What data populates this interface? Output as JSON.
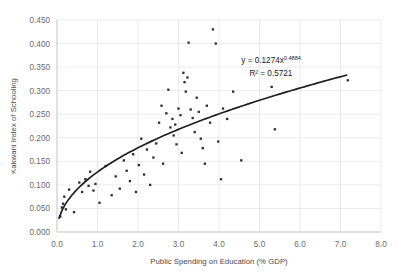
{
  "chart_data": {
    "type": "scatter",
    "title": "",
    "xlabel": "Public Spending on Education (% GDP)",
    "ylabel": "Kakwani Index of Schooling",
    "xlim": [
      0.0,
      8.0
    ],
    "ylim": [
      0.0,
      0.45
    ],
    "grid": true,
    "legend": "none",
    "xticks": [
      "0.0",
      "1.0",
      "2.0",
      "3.0",
      "4.0",
      "5.0",
      "6.0",
      "7.0",
      "8.0"
    ],
    "xtick_values": [
      0.0,
      1.0,
      2.0,
      3.0,
      4.0,
      5.0,
      6.0,
      7.0,
      8.0
    ],
    "yticks": [
      "0.000",
      "0.050",
      "0.100",
      "0.150",
      "0.200",
      "0.250",
      "0.300",
      "0.350",
      "0.400",
      "0.450"
    ],
    "ytick_values": [
      0.0,
      0.05,
      0.1,
      0.15,
      0.2,
      0.25,
      0.3,
      0.35,
      0.4,
      0.45
    ],
    "annotations": [
      {
        "name": "regression-equation",
        "text_prefix": "y = 0.1274x",
        "exponent": "0.4884",
        "x": 4.55,
        "y": 0.358
      },
      {
        "name": "r-squared",
        "text": "R² = 0.5721",
        "x": 4.75,
        "y": 0.332
      }
    ],
    "trendline": {
      "type": "power",
      "coefficient": 0.1274,
      "exponent": 0.4884,
      "label": "y = 0.1274x^0.4884",
      "r_squared": 0.5721,
      "x_start": 0.05,
      "x_end": 7.15,
      "color": "#1f1f1f"
    },
    "marker_color": "#2b2b2b",
    "points": [
      [
        0.08,
        0.033
      ],
      [
        0.12,
        0.052
      ],
      [
        0.15,
        0.06
      ],
      [
        0.18,
        0.075
      ],
      [
        0.22,
        0.048
      ],
      [
        0.3,
        0.09
      ],
      [
        0.42,
        0.042
      ],
      [
        0.55,
        0.105
      ],
      [
        0.62,
        0.085
      ],
      [
        0.7,
        0.112
      ],
      [
        0.78,
        0.098
      ],
      [
        0.82,
        0.128
      ],
      [
        0.9,
        0.088
      ],
      [
        0.95,
        0.102
      ],
      [
        1.05,
        0.062
      ],
      [
        1.2,
        0.14
      ],
      [
        1.35,
        0.078
      ],
      [
        1.45,
        0.118
      ],
      [
        1.55,
        0.092
      ],
      [
        1.65,
        0.152
      ],
      [
        1.72,
        0.13
      ],
      [
        1.8,
        0.108
      ],
      [
        1.88,
        0.165
      ],
      [
        1.95,
        0.085
      ],
      [
        2.02,
        0.142
      ],
      [
        2.08,
        0.198
      ],
      [
        2.15,
        0.122
      ],
      [
        2.22,
        0.175
      ],
      [
        2.3,
        0.1
      ],
      [
        2.38,
        0.158
      ],
      [
        2.45,
        0.188
      ],
      [
        2.52,
        0.232
      ],
      [
        2.58,
        0.268
      ],
      [
        2.62,
        0.145
      ],
      [
        2.7,
        0.252
      ],
      [
        2.75,
        0.302
      ],
      [
        2.8,
        0.222
      ],
      [
        2.85,
        0.24
      ],
      [
        2.88,
        0.205
      ],
      [
        2.92,
        0.228
      ],
      [
        2.95,
        0.186
      ],
      [
        3.0,
        0.262
      ],
      [
        3.05,
        0.248
      ],
      [
        3.08,
        0.168
      ],
      [
        3.12,
        0.338
      ],
      [
        3.15,
        0.318
      ],
      [
        3.18,
        0.298
      ],
      [
        3.22,
        0.328
      ],
      [
        3.25,
        0.402
      ],
      [
        3.3,
        0.26
      ],
      [
        3.35,
        0.242
      ],
      [
        3.4,
        0.212
      ],
      [
        3.45,
        0.285
      ],
      [
        3.5,
        0.255
      ],
      [
        3.55,
        0.198
      ],
      [
        3.6,
        0.178
      ],
      [
        3.65,
        0.145
      ],
      [
        3.7,
        0.268
      ],
      [
        3.78,
        0.232
      ],
      [
        3.85,
        0.43
      ],
      [
        3.92,
        0.4
      ],
      [
        3.98,
        0.192
      ],
      [
        4.05,
        0.112
      ],
      [
        4.1,
        0.262
      ],
      [
        4.2,
        0.24
      ],
      [
        4.35,
        0.298
      ],
      [
        4.55,
        0.152
      ],
      [
        5.3,
        0.308
      ],
      [
        5.38,
        0.218
      ],
      [
        7.18,
        0.322
      ]
    ]
  }
}
